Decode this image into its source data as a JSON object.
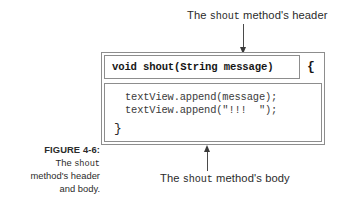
{
  "figure": {
    "number_label": "FIGURE 4-6:",
    "caption_line_1_a": "The ",
    "caption_line_1_mono": "shout",
    "caption_line_2": "method's header",
    "caption_line_3": "and body."
  },
  "callouts": {
    "header": {
      "prefix": "The ",
      "mono": "shout",
      "suffix": " method's header"
    },
    "body": {
      "prefix": "The ",
      "mono": "shout",
      "suffix": " method's body"
    }
  },
  "code": {
    "method_header": "void shout(String message)",
    "open_brace": "{",
    "body_lines": [
      "textView.append(message);",
      "textView.append(\"!!!  \");"
    ],
    "close_brace": "}"
  },
  "colors": {
    "box_border": "#8d8d8d",
    "text": "#231f20",
    "arrow": "#3a3a3a",
    "background": "#ffffff"
  },
  "icons": {
    "arrow_down": "arrow-down-icon",
    "arrow_up": "arrow-up-icon"
  }
}
